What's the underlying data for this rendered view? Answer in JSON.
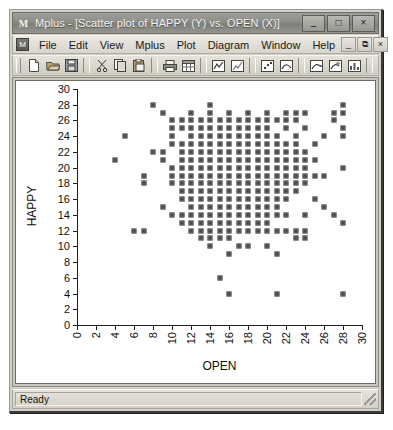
{
  "window": {
    "title": "Mplus - [Scatter plot of HAPPY (Y) vs. OPEN (X)]",
    "app_icon": "M",
    "minimize_label": "–",
    "maximize_label": "□",
    "close_label": "×"
  },
  "menubar": {
    "mdi_icon": "mplus-document-icon",
    "items": [
      {
        "label": "File"
      },
      {
        "label": "Edit"
      },
      {
        "label": "View"
      },
      {
        "label": "Mplus"
      },
      {
        "label": "Plot"
      },
      {
        "label": "Diagram"
      },
      {
        "label": "Window"
      },
      {
        "label": "Help"
      }
    ],
    "child_minimize_label": "_",
    "child_restore_label": "⧉",
    "child_close_label": "×"
  },
  "toolbar": {
    "buttons": [
      {
        "name": "new-file-icon",
        "title": "New"
      },
      {
        "name": "open-folder-icon",
        "title": "Open"
      },
      {
        "name": "save-disk-icon",
        "title": "Save"
      },
      {
        "name": "cut-scissors-icon",
        "title": "Cut"
      },
      {
        "name": "copy-icon",
        "title": "Copy"
      },
      {
        "name": "paste-clipboard-icon",
        "title": "Paste"
      },
      {
        "name": "print-icon",
        "title": "Print"
      },
      {
        "name": "table-view-icon",
        "title": "Table"
      },
      {
        "name": "line-chart-icon",
        "title": "Line plot"
      },
      {
        "name": "line-chart-alt-icon",
        "title": "Line plot 2"
      },
      {
        "name": "scatter-chart-icon",
        "title": "Scatter plot"
      },
      {
        "name": "curve-chart-icon",
        "title": "Curve plot"
      },
      {
        "name": "curve-arrow-icon",
        "title": "Curve with arrow"
      },
      {
        "name": "curve-star-icon",
        "title": "Curve highlight"
      },
      {
        "name": "bar-chart-icon",
        "title": "Bar chart"
      },
      {
        "name": "bar-chart-alt-icon",
        "title": "Bar chart 2"
      },
      {
        "name": "histogram-icon",
        "title": "Histogram"
      },
      {
        "name": "scatter-fit-icon",
        "title": "Scatter with fit"
      }
    ]
  },
  "statusbar": {
    "text": "Ready"
  },
  "chart_data": {
    "type": "scatter",
    "title": "Scatter plot of HAPPY (Y) vs. OPEN (X)",
    "xlabel": "OPEN",
    "ylabel": "HAPPY",
    "xlim": [
      0,
      30
    ],
    "ylim": [
      0,
      30
    ],
    "xticks": [
      0,
      2,
      4,
      6,
      8,
      10,
      12,
      14,
      16,
      18,
      20,
      22,
      24,
      26,
      28,
      30
    ],
    "yticks": [
      0,
      2,
      4,
      6,
      8,
      10,
      12,
      14,
      16,
      18,
      20,
      22,
      24,
      26,
      28,
      30
    ],
    "grid": false,
    "legend": null,
    "marker": "square",
    "marker_color": "#4a4a4a",
    "points": [
      [
        4,
        21
      ],
      [
        5,
        24
      ],
      [
        6,
        12
      ],
      [
        7,
        12
      ],
      [
        7,
        19
      ],
      [
        7,
        18
      ],
      [
        8,
        28
      ],
      [
        8,
        22
      ],
      [
        9,
        22
      ],
      [
        9,
        27
      ],
      [
        9,
        21
      ],
      [
        9,
        15
      ],
      [
        10,
        26
      ],
      [
        10,
        25
      ],
      [
        10,
        24
      ],
      [
        10,
        23
      ],
      [
        10,
        20
      ],
      [
        10,
        19
      ],
      [
        10,
        18
      ],
      [
        10,
        14
      ],
      [
        11,
        26
      ],
      [
        11,
        25
      ],
      [
        11,
        23
      ],
      [
        11,
        22
      ],
      [
        11,
        21
      ],
      [
        11,
        20
      ],
      [
        11,
        19
      ],
      [
        11,
        18
      ],
      [
        11,
        17
      ],
      [
        11,
        16
      ],
      [
        11,
        14
      ],
      [
        11,
        13
      ],
      [
        12,
        27
      ],
      [
        12,
        26
      ],
      [
        12,
        25
      ],
      [
        12,
        24
      ],
      [
        12,
        23
      ],
      [
        12,
        22
      ],
      [
        12,
        21
      ],
      [
        12,
        20
      ],
      [
        12,
        19
      ],
      [
        12,
        18
      ],
      [
        12,
        17
      ],
      [
        12,
        16
      ],
      [
        12,
        15
      ],
      [
        12,
        14
      ],
      [
        12,
        13
      ],
      [
        12,
        12
      ],
      [
        13,
        26
      ],
      [
        13,
        25
      ],
      [
        13,
        24
      ],
      [
        13,
        23
      ],
      [
        13,
        22
      ],
      [
        13,
        21
      ],
      [
        13,
        20
      ],
      [
        13,
        19
      ],
      [
        13,
        18
      ],
      [
        13,
        17
      ],
      [
        13,
        16
      ],
      [
        13,
        15
      ],
      [
        13,
        14
      ],
      [
        13,
        13
      ],
      [
        13,
        12
      ],
      [
        13,
        11
      ],
      [
        14,
        28
      ],
      [
        14,
        27
      ],
      [
        14,
        26
      ],
      [
        14,
        25
      ],
      [
        14,
        24
      ],
      [
        14,
        23
      ],
      [
        14,
        22
      ],
      [
        14,
        21
      ],
      [
        14,
        20
      ],
      [
        14,
        19
      ],
      [
        14,
        18
      ],
      [
        14,
        17
      ],
      [
        14,
        16
      ],
      [
        14,
        15
      ],
      [
        14,
        14
      ],
      [
        14,
        13
      ],
      [
        14,
        12
      ],
      [
        14,
        11
      ],
      [
        14,
        10
      ],
      [
        15,
        26
      ],
      [
        15,
        25
      ],
      [
        15,
        24
      ],
      [
        15,
        23
      ],
      [
        15,
        22
      ],
      [
        15,
        21
      ],
      [
        15,
        20
      ],
      [
        15,
        19
      ],
      [
        15,
        18
      ],
      [
        15,
        17
      ],
      [
        15,
        16
      ],
      [
        15,
        15
      ],
      [
        15,
        14
      ],
      [
        15,
        13
      ],
      [
        15,
        12
      ],
      [
        15,
        11
      ],
      [
        15,
        6
      ],
      [
        16,
        27
      ],
      [
        16,
        26
      ],
      [
        16,
        25
      ],
      [
        16,
        24
      ],
      [
        16,
        23
      ],
      [
        16,
        22
      ],
      [
        16,
        21
      ],
      [
        16,
        20
      ],
      [
        16,
        19
      ],
      [
        16,
        18
      ],
      [
        16,
        17
      ],
      [
        16,
        16
      ],
      [
        16,
        15
      ],
      [
        16,
        14
      ],
      [
        16,
        13
      ],
      [
        16,
        12
      ],
      [
        16,
        11
      ],
      [
        16,
        9
      ],
      [
        16,
        4
      ],
      [
        17,
        26
      ],
      [
        17,
        25
      ],
      [
        17,
        24
      ],
      [
        17,
        23
      ],
      [
        17,
        22
      ],
      [
        17,
        21
      ],
      [
        17,
        20
      ],
      [
        17,
        19
      ],
      [
        17,
        18
      ],
      [
        17,
        17
      ],
      [
        17,
        16
      ],
      [
        17,
        15
      ],
      [
        17,
        14
      ],
      [
        17,
        13
      ],
      [
        17,
        12
      ],
      [
        17,
        10
      ],
      [
        18,
        27
      ],
      [
        18,
        26
      ],
      [
        18,
        25
      ],
      [
        18,
        24
      ],
      [
        18,
        23
      ],
      [
        18,
        22
      ],
      [
        18,
        21
      ],
      [
        18,
        20
      ],
      [
        18,
        19
      ],
      [
        18,
        18
      ],
      [
        18,
        17
      ],
      [
        18,
        16
      ],
      [
        18,
        15
      ],
      [
        18,
        14
      ],
      [
        18,
        13
      ],
      [
        18,
        12
      ],
      [
        18,
        10
      ],
      [
        19,
        26
      ],
      [
        19,
        25
      ],
      [
        19,
        24
      ],
      [
        19,
        23
      ],
      [
        19,
        22
      ],
      [
        19,
        21
      ],
      [
        19,
        20
      ],
      [
        19,
        19
      ],
      [
        19,
        18
      ],
      [
        19,
        17
      ],
      [
        19,
        16
      ],
      [
        19,
        15
      ],
      [
        19,
        14
      ],
      [
        19,
        13
      ],
      [
        19,
        12
      ],
      [
        20,
        27
      ],
      [
        20,
        26
      ],
      [
        20,
        25
      ],
      [
        20,
        24
      ],
      [
        20,
        23
      ],
      [
        20,
        22
      ],
      [
        20,
        21
      ],
      [
        20,
        20
      ],
      [
        20,
        19
      ],
      [
        20,
        18
      ],
      [
        20,
        17
      ],
      [
        20,
        16
      ],
      [
        20,
        15
      ],
      [
        20,
        14
      ],
      [
        20,
        13
      ],
      [
        20,
        12
      ],
      [
        20,
        10
      ],
      [
        21,
        26
      ],
      [
        21,
        24
      ],
      [
        21,
        23
      ],
      [
        21,
        22
      ],
      [
        21,
        21
      ],
      [
        21,
        20
      ],
      [
        21,
        19
      ],
      [
        21,
        18
      ],
      [
        21,
        17
      ],
      [
        21,
        16
      ],
      [
        21,
        15
      ],
      [
        21,
        14
      ],
      [
        21,
        12
      ],
      [
        21,
        9
      ],
      [
        21,
        4
      ],
      [
        22,
        27
      ],
      [
        22,
        26
      ],
      [
        22,
        25
      ],
      [
        22,
        23
      ],
      [
        22,
        22
      ],
      [
        22,
        21
      ],
      [
        22,
        20
      ],
      [
        22,
        19
      ],
      [
        22,
        18
      ],
      [
        22,
        17
      ],
      [
        22,
        16
      ],
      [
        22,
        14
      ],
      [
        22,
        12
      ],
      [
        23,
        27
      ],
      [
        23,
        26
      ],
      [
        23,
        24
      ],
      [
        23,
        23
      ],
      [
        23,
        22
      ],
      [
        23,
        21
      ],
      [
        23,
        20
      ],
      [
        23,
        19
      ],
      [
        23,
        18
      ],
      [
        23,
        17
      ],
      [
        23,
        12
      ],
      [
        23,
        11
      ],
      [
        24,
        27
      ],
      [
        24,
        25
      ],
      [
        24,
        22
      ],
      [
        24,
        21
      ],
      [
        24,
        20
      ],
      [
        24,
        19
      ],
      [
        24,
        18
      ],
      [
        24,
        14
      ],
      [
        24,
        12
      ],
      [
        24,
        11
      ],
      [
        25,
        23
      ],
      [
        25,
        21
      ],
      [
        25,
        19
      ],
      [
        25,
        16
      ],
      [
        26,
        24
      ],
      [
        26,
        19
      ],
      [
        26,
        15
      ],
      [
        27,
        27
      ],
      [
        27,
        26
      ],
      [
        27,
        14
      ],
      [
        28,
        28
      ],
      [
        28,
        27
      ],
      [
        28,
        25
      ],
      [
        28,
        24
      ],
      [
        28,
        20
      ],
      [
        28,
        13
      ],
      [
        28,
        4
      ]
    ]
  }
}
